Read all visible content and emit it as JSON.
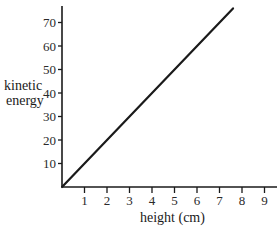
{
  "chart_data": {
    "type": "line",
    "title": "",
    "xlabel": "height (cm)",
    "ylabel": "kinetic energy",
    "ylabel_lines": [
      "kinetic",
      "energy"
    ],
    "x_ticks": [
      1,
      2,
      3,
      4,
      5,
      6,
      7,
      8,
      9
    ],
    "y_ticks": [
      10,
      20,
      30,
      40,
      50,
      60,
      70
    ],
    "xlim": [
      0,
      9.7
    ],
    "ylim": [
      0,
      78
    ],
    "grid": false,
    "legend": null,
    "series": [
      {
        "name": "kinetic energy vs height",
        "x": [
          0,
          7.6
        ],
        "y": [
          0,
          76
        ]
      }
    ],
    "colors": {
      "line": "#1a1a1a",
      "axis": "#1a1a1a"
    }
  }
}
